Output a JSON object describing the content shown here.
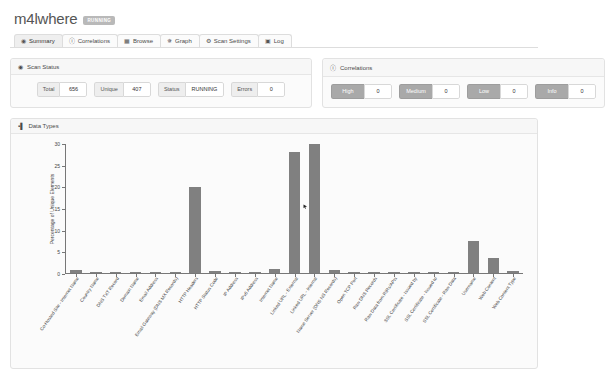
{
  "header": {
    "title": "m4lwhere",
    "status_badge": "RUNNING"
  },
  "tabs": [
    {
      "label": "Summary",
      "icon": "eye-icon",
      "glyph": "◉",
      "active": true
    },
    {
      "label": "Correlations",
      "icon": "info-icon",
      "glyph": "ⓘ",
      "active": false
    },
    {
      "label": "Browse",
      "icon": "grid-icon",
      "glyph": "▦",
      "active": false
    },
    {
      "label": "Graph",
      "icon": "node-icon",
      "glyph": "✵",
      "active": false
    },
    {
      "label": "Scan Settings",
      "icon": "gear-icon",
      "glyph": "⚙",
      "active": false
    },
    {
      "label": "Log",
      "icon": "clipboard-icon",
      "glyph": "▣",
      "active": false
    }
  ],
  "scan_status": {
    "panel_title": "Scan Status",
    "panel_icon": "globe-icon",
    "stats": [
      {
        "label": "Total",
        "value": "656"
      },
      {
        "label": "Unique",
        "value": "407"
      },
      {
        "label": "Status",
        "value": "RUNNING"
      },
      {
        "label": "Errors",
        "value": "0"
      }
    ]
  },
  "correlations": {
    "panel_title": "Correlations",
    "panel_icon": "info-icon",
    "items": [
      {
        "label": "High",
        "value": "0"
      },
      {
        "label": "Medium",
        "value": "0"
      },
      {
        "label": "Low",
        "value": "0"
      },
      {
        "label": "Info",
        "value": "0"
      }
    ]
  },
  "data_types": {
    "panel_title": "Data Types",
    "panel_icon": "bar-chart-icon"
  },
  "colors": {
    "bar": "#808080",
    "badge": "#b9b9b9",
    "panel_bg": "#fbfbfb",
    "axis": "#777777"
  },
  "chart_data": {
    "type": "bar",
    "title": "Data Types",
    "xlabel": "",
    "ylabel": "Percentage of Unique Elements",
    "ylim": [
      0,
      30
    ],
    "yticks": [
      0,
      5,
      10,
      15,
      20,
      25,
      30
    ],
    "grid": false,
    "legend": "none",
    "categories": [
      "Co-Hosted Site - Internet Name",
      "Country Name",
      "DNS TXT Record",
      "Domain Name",
      "Email Address",
      "Email Gateway (DNS MX Records)",
      "HTTP Headers",
      "HTTP Status Code",
      "IP Address",
      "IPv6 Address",
      "Internet Name",
      "Linked URL - External",
      "Linked URL - Internal",
      "Name Server (DNS NS Records)",
      "Open TCP Port",
      "Raw DNS Records",
      "Raw Data from RIRs/APIs",
      "SSL Certificate - Issued by",
      "SSL Certificate - Issued to",
      "SSL Certificate - Raw Data",
      "Username",
      "Web Content",
      "Web Content Type"
    ],
    "values": [
      0.7,
      0.25,
      0.25,
      0.25,
      0.25,
      0.25,
      20.0,
      0.5,
      0.25,
      0.25,
      0.9,
      28.2,
      30.0,
      0.7,
      0.3,
      0.25,
      0.25,
      0.25,
      0.25,
      0.25,
      7.4,
      3.4,
      0.5
    ]
  }
}
